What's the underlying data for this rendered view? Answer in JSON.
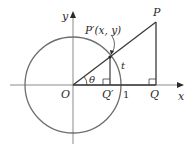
{
  "diagram": {
    "labels": {
      "y_axis": "y",
      "x_axis": "x",
      "origin": "O",
      "point_p": "P",
      "point_p_prime": "P′(x, y)",
      "point_q": "Q",
      "point_q_prime": "Q′",
      "angle": "θ",
      "arc": "t",
      "unit": "1"
    },
    "colors": {
      "circle": "#6e6e6e",
      "lines": "#3a3a3a",
      "axes": "#8a8a8a",
      "text": "#2a2a2a"
    },
    "geometry": {
      "origin": [
        73,
        85
      ],
      "radius": 48,
      "p": [
        156,
        22
      ],
      "p_prime": [
        110,
        57
      ],
      "q": [
        156,
        85
      ],
      "q_prime": [
        110,
        85
      ]
    }
  }
}
